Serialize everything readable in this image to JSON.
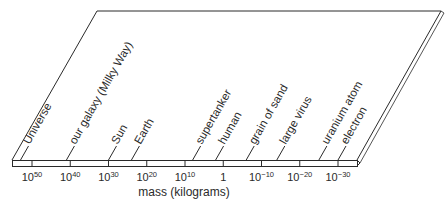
{
  "diagram": {
    "type": "logarithmic mass scale on a slanted plane",
    "axis_label": "mass (kilograms)",
    "ticks": [
      {
        "base": "10",
        "exp": "50"
      },
      {
        "base": "10",
        "exp": "40"
      },
      {
        "base": "10",
        "exp": "30"
      },
      {
        "base": "10",
        "exp": "20"
      },
      {
        "base": "10",
        "exp": "10"
      },
      {
        "base": "1",
        "exp": ""
      },
      {
        "base": "10",
        "exp": "−10"
      },
      {
        "base": "10",
        "exp": "−20"
      },
      {
        "base": "10",
        "exp": "−30"
      }
    ],
    "objects": [
      {
        "label": "Universe",
        "log_mass": 53
      },
      {
        "label": "our galaxy (Milky Way)",
        "log_mass": 41
      },
      {
        "label": "Sun",
        "log_mass": 30
      },
      {
        "label": "Earth",
        "log_mass": 24
      },
      {
        "label": "supertanker",
        "log_mass": 8
      },
      {
        "label": "human",
        "log_mass": 2
      },
      {
        "label": "grain of sand",
        "log_mass": -6
      },
      {
        "label": "large virus",
        "log_mass": -14
      },
      {
        "label": "uranium atom",
        "log_mass": -25
      },
      {
        "label": "electron",
        "log_mass": -30
      }
    ],
    "colors": {
      "line": "#2a2a2a",
      "background": "#ffffff"
    }
  }
}
